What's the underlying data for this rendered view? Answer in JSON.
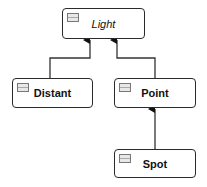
{
  "diagram": {
    "type": "class-hierarchy",
    "nodes": {
      "light": {
        "label": "Light",
        "style": "italic"
      },
      "distant": {
        "label": "Distant",
        "style": "bold"
      },
      "point": {
        "label": "Point",
        "style": "bold"
      },
      "spot": {
        "label": "Spot",
        "style": "bold"
      }
    },
    "edges": [
      {
        "from": "Distant",
        "to": "Light",
        "type": "inheritance-arrow"
      },
      {
        "from": "Point",
        "to": "Light",
        "type": "inheritance-arrow"
      },
      {
        "from": "Spot",
        "to": "Point",
        "type": "inheritance-arrow"
      }
    ]
  }
}
